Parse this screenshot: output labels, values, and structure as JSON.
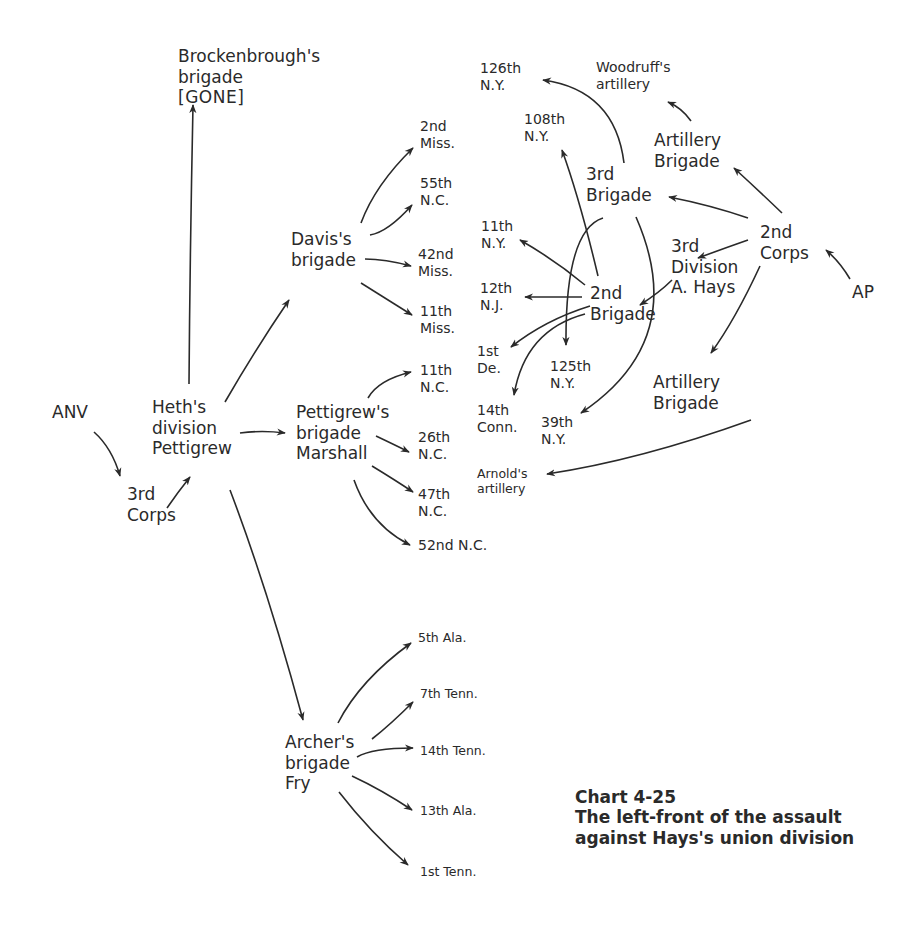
{
  "diagram": {
    "title": "Chart 4-25",
    "subtitle_line1": "The left-front of the assault",
    "subtitle_line2": "against Hays's union division",
    "nodes": {
      "anv": "ANV",
      "third_corps": "3rd\nCorps",
      "heth_division": "Heth's\ndivision\nPettigrew",
      "brockenbrough": "Brockenbrough's\nbrigade",
      "brockenbrough_status": "[GONE]",
      "davis_brigade": "Davis's\nbrigade",
      "pettigrew_brigade": "Pettigrew's\nbrigade\nMarshall",
      "archer_brigade": "Archer's\nbrigade\nFry",
      "miss_2nd": "2nd\nMiss.",
      "nc_55th": "55th\nN.C.",
      "miss_42nd": "42nd\nMiss.",
      "miss_11th": "11th\nMiss.",
      "nc_11th": "11th\nN.C.",
      "nc_26th": "26th\nN.C.",
      "nc_47th": "47th\nN.C.",
      "nc_52nd": "52nd N.C.",
      "ala_5th": "5th Ala.",
      "tenn_7th": "7th Tenn.",
      "tenn_14th": "14th Tenn.",
      "ala_13th": "13th Ala.",
      "tenn_1st": "1st Tenn.",
      "ap": "AP",
      "second_corps": "2nd\nCorps",
      "third_division": "3rd\nDivision\nA. Hays",
      "artillery_brigade_top": "Artillery\nBrigade",
      "artillery_brigade_bottom": "Artillery\nBrigade",
      "woodruff": "Woodruff's\nartillery",
      "arnold": "Arnold's\nartillery",
      "third_brigade": "3rd\nBrigade",
      "second_brigade": "2nd\nBrigade",
      "ny_126th": "126th\nN.Y.",
      "ny_108th": "108th\nN.Y.",
      "ny_11th": "11th\nN.Y.",
      "nj_12th": "12th\nN.J.",
      "de_1st": "1st\nDe.",
      "conn_14th": "14th\nConn.",
      "ny_125th": "125th\nN.Y.",
      "ny_39th": "39th\nN.Y."
    },
    "edges": [
      [
        "ANV",
        "3rd Corps"
      ],
      [
        "3rd Corps",
        "Heth's division"
      ],
      [
        "Heth's division",
        "Brockenbrough's brigade"
      ],
      [
        "Heth's division",
        "Davis's brigade"
      ],
      [
        "Heth's division",
        "Pettigrew's brigade"
      ],
      [
        "Heth's division",
        "Archer's brigade"
      ],
      [
        "Davis's brigade",
        "2nd Miss."
      ],
      [
        "Davis's brigade",
        "55th N.C."
      ],
      [
        "Davis's brigade",
        "42nd Miss."
      ],
      [
        "Davis's brigade",
        "11th Miss."
      ],
      [
        "Pettigrew's brigade",
        "11th N.C."
      ],
      [
        "Pettigrew's brigade",
        "26th N.C."
      ],
      [
        "Pettigrew's brigade",
        "47th N.C."
      ],
      [
        "Pettigrew's brigade",
        "52nd N.C."
      ],
      [
        "Archer's brigade",
        "5th Ala."
      ],
      [
        "Archer's brigade",
        "7th Tenn."
      ],
      [
        "Archer's brigade",
        "14th Tenn."
      ],
      [
        "Archer's brigade",
        "13th Ala."
      ],
      [
        "Archer's brigade",
        "1st Tenn."
      ],
      [
        "AP",
        "2nd Corps"
      ],
      [
        "2nd Corps",
        "Artillery Brigade (top)"
      ],
      [
        "2nd Corps",
        "3rd Brigade"
      ],
      [
        "2nd Corps",
        "3rd Division"
      ],
      [
        "2nd Corps",
        "Artillery Brigade (bottom)"
      ],
      [
        "3rd Division",
        "2nd Brigade"
      ],
      [
        "Artillery Brigade (top)",
        "Woodruff's artillery"
      ],
      [
        "Artillery Brigade (bottom)",
        "Arnold's artillery"
      ],
      [
        "3rd Brigade",
        "126th N.Y."
      ],
      [
        "3rd Brigade",
        "125th N.Y."
      ],
      [
        "3rd Brigade",
        "39th N.Y."
      ],
      [
        "2nd Brigade",
        "108th N.Y."
      ],
      [
        "2nd Brigade",
        "11th N.Y."
      ],
      [
        "2nd Brigade",
        "12th N.J."
      ],
      [
        "2nd Brigade",
        "1st De."
      ],
      [
        "2nd Brigade",
        "14th Conn."
      ]
    ]
  }
}
